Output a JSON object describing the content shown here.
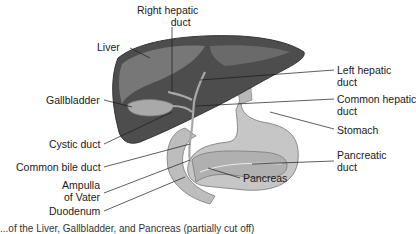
{
  "diagram": {
    "labels": {
      "right_hepatic_duct": [
        "Right hepatic",
        "duct"
      ],
      "liver": "Liver",
      "left_hepatic_duct": [
        "Left hepatic",
        "duct"
      ],
      "gallbladder": "Gallbladder",
      "common_hepatic_duct": [
        "Common hepatic",
        "duct"
      ],
      "stomach": "Stomach",
      "cystic_duct": "Cystic duct",
      "common_bile_duct": "Common bile duct",
      "pancreatic_duct": [
        "Pancreatic",
        "duct"
      ],
      "ampulla_of_vater": [
        "Ampulla",
        "of Vater"
      ],
      "pancreas": "Pancreas",
      "duodenum": "Duodenum"
    },
    "caption": "...of the Liver, Gallbladder, and Pancreas (partially cut off)",
    "colors": {
      "liver_dark": "#4a4a4a",
      "liver_light": "#6f6f6f",
      "stomach": "#c4c4c4",
      "duct": "#9a9a9a",
      "leader_line": "#1a1a1a"
    }
  }
}
